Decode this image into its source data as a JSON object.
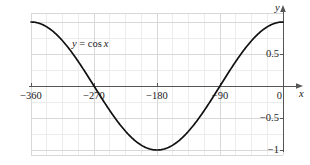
{
  "chart_data": {
    "type": "line",
    "title": "",
    "subtitle": "",
    "xlabel": "x",
    "ylabel": "y",
    "annotation": "y = cos x",
    "annotation_parts": {
      "var_y": "y",
      "equals": " = ",
      "func": "cos",
      "var_x": "x"
    },
    "xlim": [
      -360,
      0
    ],
    "ylim": [
      -1.15,
      1.15
    ],
    "grid": true,
    "legend": "none",
    "x_ticks": [
      -360,
      -270,
      -180,
      -90,
      0
    ],
    "x_tick_labels": [
      "−360",
      "−270",
      "−180",
      "−90",
      "0"
    ],
    "y_ticks": [
      1,
      0.5,
      -0.5,
      -1
    ],
    "y_tick_labels": [
      "1",
      "0.5",
      "−0.5",
      "−1"
    ],
    "x_minor_step": 22.5,
    "y_minor_step": 0.25,
    "series": [
      {
        "name": "y = cos x",
        "color": "#111111",
        "x": [
          -360,
          -352.5,
          -345,
          -337.5,
          -330,
          -322.5,
          -315,
          -307.5,
          -300,
          -292.5,
          -285,
          -277.5,
          -270,
          -262.5,
          -255,
          -247.5,
          -240,
          -232.5,
          -225,
          -217.5,
          -210,
          -202.5,
          -195,
          -187.5,
          -180,
          -172.5,
          -165,
          -157.5,
          -150,
          -142.5,
          -135,
          -127.5,
          -120,
          -112.5,
          -105,
          -97.5,
          -90,
          -82.5,
          -75,
          -67.5,
          -60,
          -52.5,
          -45,
          -37.5,
          -30,
          -22.5,
          -15,
          -7.5,
          0
        ],
        "y": [
          1.0,
          0.9914,
          0.9659,
          0.9239,
          0.866,
          0.7934,
          0.7071,
          0.6088,
          0.5,
          0.3827,
          0.2588,
          0.1305,
          0.0,
          -0.1305,
          -0.2588,
          -0.3827,
          -0.5,
          -0.6088,
          -0.7071,
          -0.7934,
          -0.866,
          -0.9239,
          -0.9659,
          -0.9914,
          -1.0,
          -0.9914,
          -0.9659,
          -0.9239,
          -0.866,
          -0.7934,
          -0.7071,
          -0.6088,
          -0.5,
          -0.3827,
          -0.2588,
          -0.1305,
          0.0,
          0.1305,
          0.2588,
          0.3827,
          0.5,
          0.6088,
          0.7071,
          0.7934,
          0.866,
          0.9239,
          0.9659,
          0.9914,
          1.0
        ]
      }
    ],
    "colors": {
      "curve": "#111111",
      "axis": "#555555",
      "grid_major": "#d8d8d8",
      "grid_minor": "#ececec",
      "background": "#ffffff",
      "text": "#1a1a1a"
    }
  },
  "axes": {
    "x_axis_name": "x",
    "y_axis_name": "y"
  }
}
